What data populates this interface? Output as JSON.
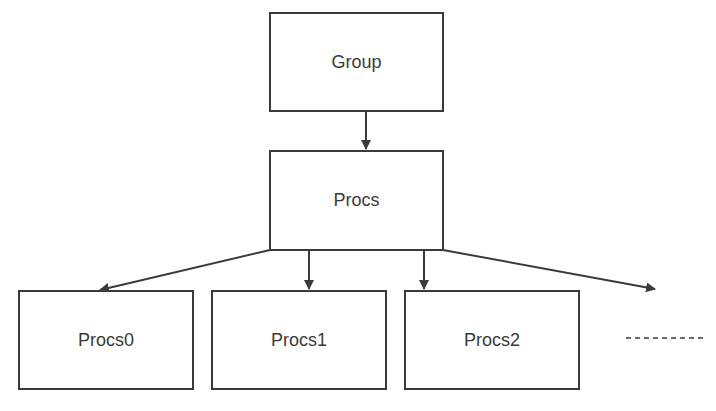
{
  "diagram": {
    "type": "hierarchy",
    "nodes": [
      {
        "id": "group",
        "label": "Group"
      },
      {
        "id": "procs",
        "label": "Procs"
      },
      {
        "id": "procs0",
        "label": "Procs0"
      },
      {
        "id": "procs1",
        "label": "Procs1"
      },
      {
        "id": "procs2",
        "label": "Procs2"
      }
    ],
    "edges": [
      [
        "group",
        "procs"
      ],
      [
        "procs",
        "procs0"
      ],
      [
        "procs",
        "procs1"
      ],
      [
        "procs",
        "procs2"
      ],
      [
        "procs",
        "more"
      ]
    ],
    "continuation": "- - - - - - - -",
    "colors": {
      "stroke": "#3a3a3a",
      "background": "#ffffff"
    }
  }
}
